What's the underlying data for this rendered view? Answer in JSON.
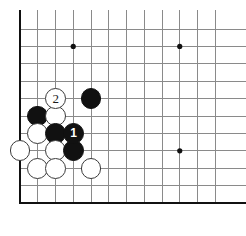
{
  "figure": {
    "name": "go-board-diagram",
    "type": "go-board-corner-diagram",
    "width": 246,
    "height": 236,
    "background_color": "#ffffff"
  },
  "board": {
    "corner": "bottom-left",
    "edge_line_color": "#111111",
    "grid_line_color": "#8a8a8a",
    "edge_line_width": 2.6,
    "grid_line_width": 1.0,
    "origin_x": 20,
    "origin_y": 29,
    "spacing_x": 17.75,
    "spacing_y": 17.4,
    "cols": 12,
    "rows": 11,
    "left_edge_index": 0,
    "bottom_edge_index": 10,
    "star_points": [
      {
        "name": "star-point-top-left",
        "col": 3,
        "row": 1
      },
      {
        "name": "star-point-top-right",
        "col": 9,
        "row": 1
      },
      {
        "name": "star-point-bottom-right",
        "col": 9,
        "row": 7
      }
    ],
    "star_point_radius": 2.6,
    "star_point_color": "#111111"
  },
  "stones": {
    "radius": 10.4,
    "black_color": "#111111",
    "white_color": "#ffffff",
    "white_outline_color": "#3a3a3a",
    "black_label_color": "#ffffff",
    "white_label_color": "#1a1a1a",
    "items": [
      {
        "name": "white-stone-move-2",
        "color": "white",
        "col": 2,
        "row": 4,
        "label": "2"
      },
      {
        "name": "black-stone-e",
        "color": "black",
        "col": 4,
        "row": 4,
        "label": ""
      },
      {
        "name": "black-stone-a",
        "color": "black",
        "col": 1,
        "row": 5,
        "label": ""
      },
      {
        "name": "white-stone-a",
        "color": "white",
        "col": 2,
        "row": 5,
        "label": ""
      },
      {
        "name": "white-stone-b",
        "color": "white",
        "col": 1,
        "row": 6,
        "label": ""
      },
      {
        "name": "black-stone-b",
        "color": "black",
        "col": 2,
        "row": 6,
        "label": ""
      },
      {
        "name": "black-stone-move-1",
        "color": "black",
        "col": 3,
        "row": 6,
        "label": "1"
      },
      {
        "name": "white-stone-c",
        "color": "white",
        "col": 0,
        "row": 7,
        "label": ""
      },
      {
        "name": "white-stone-d",
        "color": "white",
        "col": 2,
        "row": 7,
        "label": ""
      },
      {
        "name": "black-stone-c",
        "color": "black",
        "col": 3,
        "row": 7,
        "label": ""
      },
      {
        "name": "white-stone-e",
        "color": "white",
        "col": 1,
        "row": 8,
        "label": ""
      },
      {
        "name": "white-stone-f",
        "color": "white",
        "col": 2,
        "row": 8,
        "label": ""
      },
      {
        "name": "white-stone-g",
        "color": "white",
        "col": 4,
        "row": 8,
        "label": ""
      }
    ]
  },
  "move_labels": {
    "move_1": "1",
    "move_2": "2"
  }
}
